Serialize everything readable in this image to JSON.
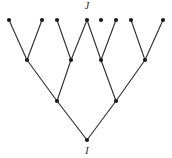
{
  "figure": {
    "kind": "binary-tree-diagram",
    "width": 172,
    "height": 158,
    "background_color": "#ffffff",
    "stroke_color": "#2b2b2b",
    "node_fill_color": "#1a1a1a",
    "edge_width": 1.1,
    "node_radius": 2.1
  },
  "labels": [
    {
      "id": "label-J",
      "text": "J",
      "x": 87,
      "y": 1,
      "anchor_node": "leaf-4",
      "position": "above"
    },
    {
      "id": "label-I",
      "text": "I",
      "x": 87,
      "y": 146,
      "anchor_node": "root",
      "position": "below"
    }
  ],
  "nodes": [
    {
      "id": "leaf-1",
      "x": 9,
      "y": 20,
      "level": 0
    },
    {
      "id": "leaf-2",
      "x": 42,
      "y": 20,
      "level": 0
    },
    {
      "id": "leaf-3",
      "x": 57,
      "y": 20,
      "level": 0
    },
    {
      "id": "leaf-4",
      "x": 87,
      "y": 20,
      "level": 0
    },
    {
      "id": "leaf-5",
      "x": 116,
      "y": 20,
      "level": 0
    },
    {
      "id": "leaf-6",
      "x": 131,
      "y": 20,
      "level": 0
    },
    {
      "id": "leaf-7",
      "x": 163,
      "y": 20,
      "level": 0
    },
    {
      "id": "leaf-8",
      "x": 101,
      "y": 20,
      "level": 0
    },
    {
      "id": "mid-1",
      "x": 27,
      "y": 60,
      "level": 1
    },
    {
      "id": "mid-2",
      "x": 71,
      "y": 60,
      "level": 1
    },
    {
      "id": "mid-3",
      "x": 101,
      "y": 60,
      "level": 1
    },
    {
      "id": "mid-4",
      "x": 145,
      "y": 60,
      "level": 1
    },
    {
      "id": "inner-1",
      "x": 57,
      "y": 101,
      "level": 2
    },
    {
      "id": "inner-2",
      "x": 116,
      "y": 101,
      "level": 2
    },
    {
      "id": "root",
      "x": 87,
      "y": 140,
      "level": 3
    }
  ],
  "edges": [
    {
      "from": "leaf-1",
      "to": "mid-1"
    },
    {
      "from": "leaf-2",
      "to": "mid-1"
    },
    {
      "from": "leaf-3",
      "to": "mid-2"
    },
    {
      "from": "leaf-4",
      "to": "mid-2"
    },
    {
      "from": "leaf-4",
      "to": "mid-3"
    },
    {
      "from": "leaf-5",
      "to": "mid-3"
    },
    {
      "from": "leaf-6",
      "to": "mid-4"
    },
    {
      "from": "leaf-7",
      "to": "mid-4"
    },
    {
      "from": "mid-1",
      "to": "inner-1"
    },
    {
      "from": "mid-2",
      "to": "inner-1"
    },
    {
      "from": "mid-3",
      "to": "inner-2"
    },
    {
      "from": "mid-4",
      "to": "inner-2"
    },
    {
      "from": "inner-1",
      "to": "root"
    },
    {
      "from": "inner-2",
      "to": "root"
    }
  ]
}
